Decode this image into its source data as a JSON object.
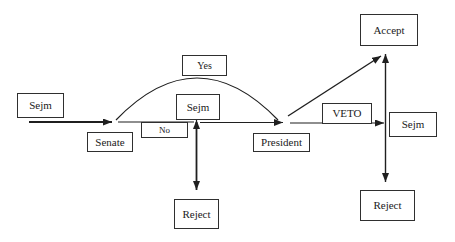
{
  "diagram": {
    "nodes": {
      "sejm1": "Sejm",
      "senate": "Senate",
      "no": "No",
      "yes": "Yes",
      "sejm2": "Sejm",
      "president": "President",
      "veto": "VETO",
      "sejm3": "Sejm",
      "accept": "Accept",
      "reject_mid": "Reject",
      "reject_right": "Reject"
    },
    "edges": [
      {
        "from": "Sejm",
        "to": "Senate",
        "label": ""
      },
      {
        "from": "Senate",
        "to": "Sejm",
        "label": "No"
      },
      {
        "from": "Senate",
        "to": "President",
        "label": "Yes"
      },
      {
        "from": "Sejm",
        "to": "President",
        "label": ""
      },
      {
        "from": "Sejm",
        "to": "Reject",
        "label": ""
      },
      {
        "from": "President",
        "to": "Accept",
        "label": ""
      },
      {
        "from": "President",
        "to": "Sejm",
        "label": "VETO"
      },
      {
        "from": "Sejm",
        "to": "Accept",
        "label": ""
      },
      {
        "from": "Sejm",
        "to": "Reject",
        "label": ""
      }
    ],
    "colors": {
      "background": "#ffffff",
      "line": "#1f1f1f",
      "box_border": "#2f2f2f",
      "box_fill": "#ffffff",
      "text": "#1a1a1a"
    }
  }
}
